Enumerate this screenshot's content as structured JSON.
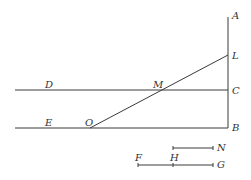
{
  "figure": {
    "labels": {
      "A": "A",
      "L": "L",
      "C": "C",
      "B": "B",
      "D": "D",
      "M": "M",
      "E": "E",
      "O": "O",
      "N": "N",
      "F": "F",
      "H": "H",
      "G": "G"
    },
    "line_color": "#3a3a3a"
  }
}
